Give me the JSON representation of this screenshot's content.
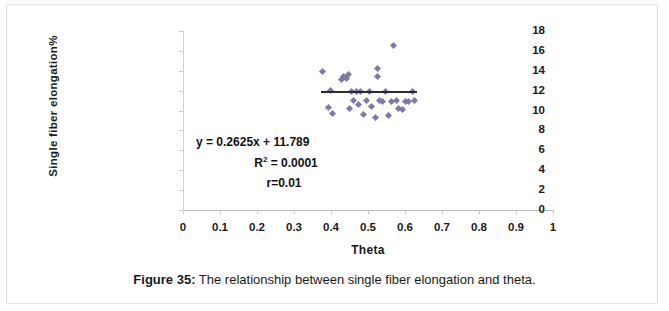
{
  "figure": {
    "caption_label": "Figure 35:",
    "caption_text": " The relationship between single fiber elongation and theta."
  },
  "chart_data": {
    "type": "scatter",
    "title": "",
    "xlabel": "Theta",
    "ylabel": "Single fiber elongation%",
    "xlim": [
      0,
      1
    ],
    "ylim": [
      0,
      18
    ],
    "xticks": [
      "0",
      "0.1",
      "0.2",
      "0.3",
      "0.4",
      "0.5",
      "0.6",
      "0.7",
      "0.8",
      "0.9",
      "1"
    ],
    "xtick_values": [
      0,
      0.1,
      0.2,
      0.3,
      0.4,
      0.5,
      0.6,
      0.7,
      0.8,
      0.9,
      1
    ],
    "yticks": [
      "0",
      "2",
      "4",
      "6",
      "8",
      "10",
      "12",
      "14",
      "16",
      "18"
    ],
    "ytick_values": [
      0,
      2,
      4,
      6,
      8,
      10,
      12,
      14,
      16,
      18
    ],
    "grid": false,
    "legend": false,
    "marker_color": "#7b7bab",
    "marker_shape": "diamond",
    "points": [
      {
        "x": 0.378,
        "y": 13.9
      },
      {
        "x": 0.392,
        "y": 10.3
      },
      {
        "x": 0.398,
        "y": 12.0
      },
      {
        "x": 0.404,
        "y": 9.7
      },
      {
        "x": 0.428,
        "y": 13.1
      },
      {
        "x": 0.434,
        "y": 13.4
      },
      {
        "x": 0.441,
        "y": 13.2
      },
      {
        "x": 0.447,
        "y": 13.6
      },
      {
        "x": 0.449,
        "y": 10.2
      },
      {
        "x": 0.456,
        "y": 11.9
      },
      {
        "x": 0.462,
        "y": 11.0
      },
      {
        "x": 0.468,
        "y": 11.9
      },
      {
        "x": 0.474,
        "y": 10.6
      },
      {
        "x": 0.481,
        "y": 11.9
      },
      {
        "x": 0.489,
        "y": 9.6
      },
      {
        "x": 0.497,
        "y": 11.0
      },
      {
        "x": 0.503,
        "y": 11.9
      },
      {
        "x": 0.51,
        "y": 10.4
      },
      {
        "x": 0.519,
        "y": 9.3
      },
      {
        "x": 0.527,
        "y": 14.2
      },
      {
        "x": 0.527,
        "y": 13.4
      },
      {
        "x": 0.531,
        "y": 11.0
      },
      {
        "x": 0.54,
        "y": 10.9
      },
      {
        "x": 0.548,
        "y": 11.9
      },
      {
        "x": 0.556,
        "y": 9.5
      },
      {
        "x": 0.563,
        "y": 10.9
      },
      {
        "x": 0.57,
        "y": 16.5
      },
      {
        "x": 0.576,
        "y": 11.0
      },
      {
        "x": 0.583,
        "y": 10.2
      },
      {
        "x": 0.592,
        "y": 10.1
      },
      {
        "x": 0.6,
        "y": 10.9
      },
      {
        "x": 0.609,
        "y": 10.9
      },
      {
        "x": 0.62,
        "y": 11.9
      },
      {
        "x": 0.626,
        "y": 11.0
      }
    ],
    "trendline": {
      "equation": "y = 0.2625x + 11.789",
      "r_squared_label": "R",
      "r_squared_exponent": "2",
      "r_squared_value": " = 0.0001",
      "r_label": "r=0.01",
      "slope": 0.2625,
      "intercept": 11.789,
      "x_start": 0.372,
      "x_end": 0.632,
      "color": "#2b2b2b"
    }
  }
}
